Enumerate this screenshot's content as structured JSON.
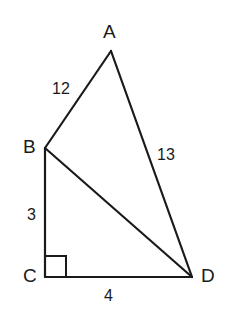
{
  "figure": {
    "background_color": "#ffffff",
    "stroke_color": "#1a1a1a",
    "width": 229,
    "height": 315,
    "vertices": [
      {
        "name": "A",
        "label": "A",
        "x": 111,
        "y": 51
      },
      {
        "name": "B",
        "label": "B",
        "x": 45,
        "y": 148
      },
      {
        "name": "C",
        "label": "C",
        "x": 45,
        "y": 277
      },
      {
        "name": "D",
        "label": "D",
        "x": 192,
        "y": 277
      }
    ],
    "edges": [
      {
        "name": "AB",
        "from": "A",
        "to": "B",
        "length_label": "12"
      },
      {
        "name": "AD",
        "from": "A",
        "to": "D",
        "length_label": "13"
      },
      {
        "name": "BD",
        "from": "B",
        "to": "D",
        "length_label": ""
      },
      {
        "name": "BC",
        "from": "B",
        "to": "C",
        "length_label": "3"
      },
      {
        "name": "CD",
        "from": "C",
        "to": "D",
        "length_label": "4"
      }
    ],
    "right_angle": {
      "at_vertex": "C",
      "size": 21,
      "marker": "square"
    },
    "labels": {
      "vertex_a": "A",
      "vertex_b": "B",
      "vertex_c": "C",
      "vertex_d": "D",
      "side_ab": "12",
      "side_ad": "13",
      "side_bc": "3",
      "side_cd": "4"
    }
  }
}
